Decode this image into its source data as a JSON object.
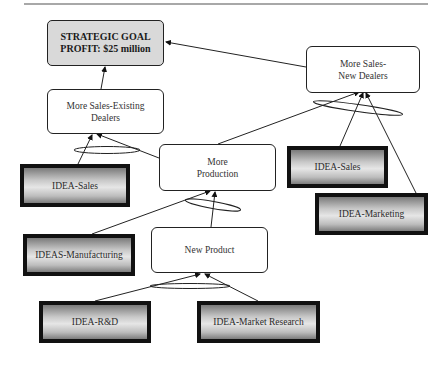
{
  "diagram": {
    "type": "goal-tree",
    "goal": {
      "line1": "STRATEGIC GOAL",
      "line2": "PROFIT: $25 million"
    },
    "outcomes": [
      {
        "id": "existing",
        "label": "More Sales-Existing\nDealers"
      },
      {
        "id": "newdealers",
        "label": "More Sales-\nNew Dealers"
      },
      {
        "id": "production",
        "label": "More\nProduction"
      },
      {
        "id": "newproduct",
        "label": "New Product"
      }
    ],
    "ideas": [
      {
        "id": "sales_left",
        "label": "IDEA-Sales",
        "feeds": "existing"
      },
      {
        "id": "sales_right",
        "label": "IDEA-Sales",
        "feeds": "newdealers"
      },
      {
        "id": "marketing",
        "label": "IDEA-Marketing",
        "feeds": "newdealers"
      },
      {
        "id": "manufacturing",
        "label": "IDEAS-Manufacturing",
        "feeds": "production"
      },
      {
        "id": "rnd",
        "label": "IDEA-R&D",
        "feeds": "newproduct"
      },
      {
        "id": "research",
        "label": "IDEA-Market Research",
        "feeds": "newproduct"
      }
    ],
    "colors": {
      "goal_fill": "#d9d9d9",
      "outline": "#222222",
      "idea_border": "#111111"
    }
  }
}
